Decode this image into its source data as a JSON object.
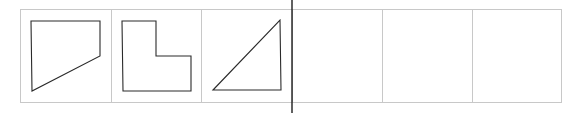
{
  "figure": {
    "width": 577,
    "height": 117,
    "background": "#ffffff",
    "grid": {
      "left": 20,
      "top": 9,
      "bottom": 102,
      "column_edges": [
        20,
        111,
        201,
        292,
        382,
        472,
        561
      ],
      "cell_count": 6,
      "line_color": "#c8c8c8",
      "line_width": 1
    },
    "divider": {
      "x": 292,
      "y1": 0,
      "y2": 113,
      "color": "#1e1e1e",
      "width": 1.4
    },
    "shape_stroke": {
      "color": "#2a2a2a",
      "width": 1.1
    },
    "cells": [
      {
        "index": 1,
        "content": "trapezoid",
        "points": "31,21 100,21 100,56 32,91"
      },
      {
        "index": 2,
        "content": "l-shape",
        "points": "122,21 156,21 156,56 191,56 191,91 123,91"
      },
      {
        "index": 3,
        "content": "right-triangle",
        "points": "213,90 280,20 281,90"
      },
      {
        "index": 4,
        "content": "empty"
      },
      {
        "index": 5,
        "content": "empty"
      },
      {
        "index": 6,
        "content": "empty"
      }
    ]
  }
}
